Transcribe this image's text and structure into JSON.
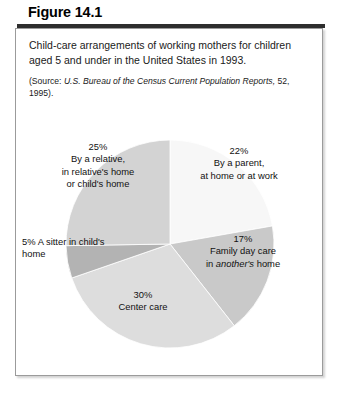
{
  "figure": {
    "title": "Figure 14.1",
    "caption": "Child-care arrangements of working mothers for children aged 5 and under in the United States in 1993.",
    "source_prefix": "(Source:",
    "source_italic": "U.S. Bureau of the Census Current Population  Reports,",
    "source_suffix": "52, 1995)."
  },
  "chart_data": {
    "type": "pie",
    "title": "Child-care arrangements of working mothers for children aged 5 and under in the United States in 1993.",
    "source": "(Source: U.S. Bureau of the Census Current Population Reports, 52, 1995).",
    "units": "percent",
    "start_angle_deg": 0,
    "direction": "clockwise",
    "categories": [
      "By a parent, at home or at work",
      "Family day care in another's home",
      "Center care",
      "A sitter in child's home",
      "By a relative, in relative's home or child's home"
    ],
    "values": [
      22,
      17,
      30,
      5,
      25
    ],
    "colors": [
      "#f7f7f7",
      "#c9c9c9",
      "#dddddd",
      "#b3b3b3",
      "#d3d3d3"
    ],
    "slices": [
      {
        "percent_label": "22%",
        "line1": "By a parent,",
        "line2": "at home or at work",
        "value": 22,
        "color": "#f7f7f7"
      },
      {
        "percent_label": "17%",
        "line1": "Family day care",
        "line2_pre": "in ",
        "line2_em": "another's",
        "line2_post": " home",
        "value": 17,
        "color": "#c9c9c9"
      },
      {
        "percent_label": "30%",
        "line1": "Center care",
        "value": 30,
        "color": "#dddddd"
      },
      {
        "percent_label": "5%",
        "line1": "5% A sitter in child's",
        "line2": "home",
        "value": 5,
        "color": "#b3b3b3"
      },
      {
        "percent_label": "25%",
        "line1": "By a relative,",
        "line2": "in relative's home",
        "line3": "or child's home",
        "value": 25,
        "color": "#d3d3d3"
      }
    ]
  }
}
